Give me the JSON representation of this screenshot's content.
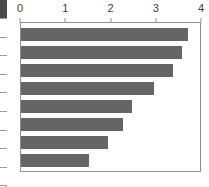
{
  "side_table": {
    "name": "row-label-column",
    "header_cell": "",
    "row_count": 9,
    "header_color": "#4a4a4a",
    "border_color": "#9a9a9a"
  },
  "chart_data": {
    "type": "bar",
    "orientation": "horizontal",
    "title": "",
    "xlabel": "",
    "ylabel": "",
    "xlim": [
      0,
      4
    ],
    "xticks": [
      0,
      1,
      2,
      3,
      4
    ],
    "xtick_labels": [
      "0",
      "1",
      "2",
      "3",
      "4"
    ],
    "grid": false,
    "legend": false,
    "categories": [
      "1",
      "2",
      "3",
      "4",
      "5",
      "6",
      "7",
      "8"
    ],
    "values": [
      3.7,
      3.55,
      3.35,
      2.95,
      2.45,
      2.25,
      1.93,
      1.5
    ],
    "bar_color": "#656565",
    "frame_color": "#8e8e8e",
    "background_color": "#ffffff",
    "axis_text_color": "#3c3c3c"
  }
}
